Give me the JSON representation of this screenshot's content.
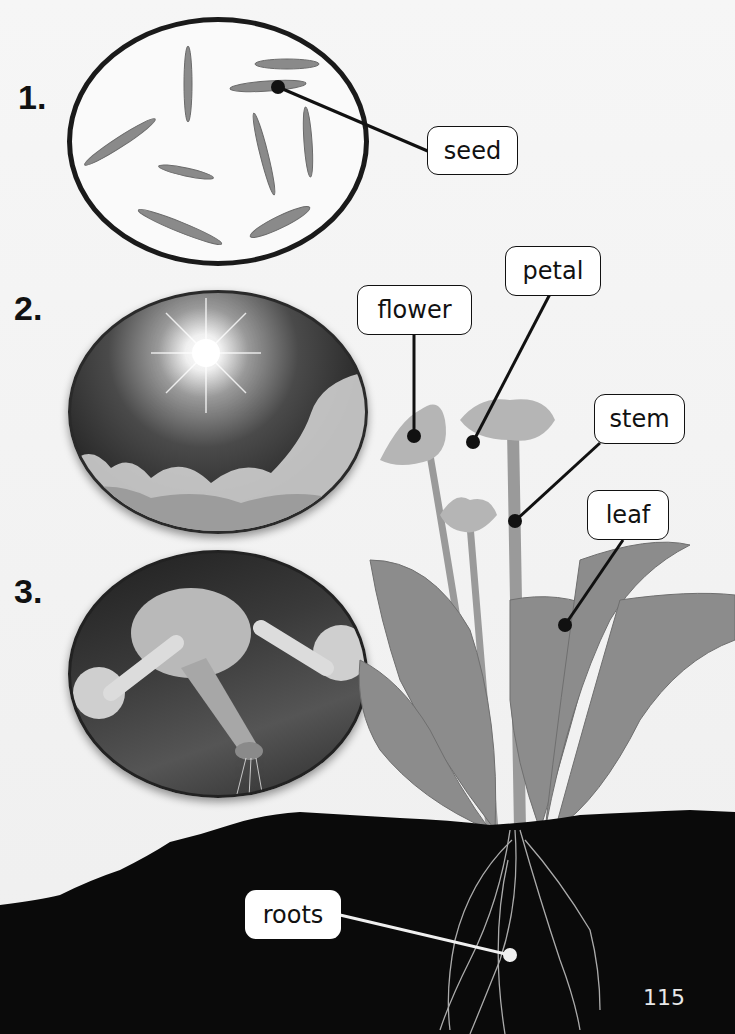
{
  "steps": [
    {
      "number": "1.",
      "image": "seeds-photo",
      "label": "seed"
    },
    {
      "number": "2.",
      "image": "sun-sky-photo"
    },
    {
      "number": "3.",
      "image": "watering-can-photo"
    }
  ],
  "plant_labels": {
    "flower": "flower",
    "petal": "petal",
    "stem": "stem",
    "leaf": "leaf",
    "roots": "roots"
  },
  "page_number": "115",
  "colors": {
    "background": "#f3f3f3",
    "line": "#111111",
    "soil": "#0a0a0a",
    "roots_line": "#f0f0f0"
  }
}
